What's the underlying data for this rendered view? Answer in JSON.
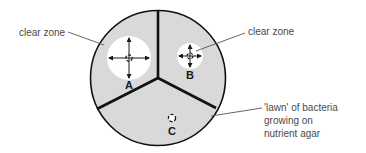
{
  "diagram": {
    "type": "labelled-diagram",
    "colors": {
      "agar_lawn": "#d9d9d9",
      "clear_zone": "#ffffff",
      "outline": "#111111",
      "label_text": "#4a4a4a",
      "leader_line": "#555555"
    },
    "plate": {
      "center": [
        158,
        78
      ],
      "radius": 68
    },
    "sections": [
      {
        "id": "A",
        "letter": "A",
        "clear_zone_radius": 22,
        "clear_zone": true
      },
      {
        "id": "B",
        "letter": "B",
        "clear_zone_radius": 13,
        "clear_zone": true
      },
      {
        "id": "C",
        "letter": "C",
        "clear_zone_radius": 0,
        "clear_zone": false
      }
    ],
    "labels": {
      "clear_zone_left": "clear zone",
      "clear_zone_right": "clear zone",
      "lawn_line1": "'lawn' of bacteria",
      "lawn_line2": "growing on",
      "lawn_line3": "nutrient agar"
    }
  }
}
